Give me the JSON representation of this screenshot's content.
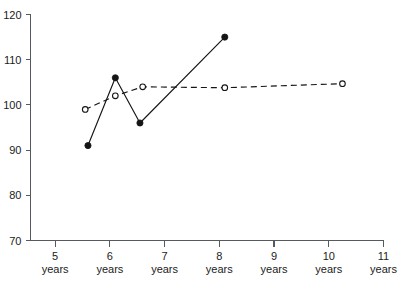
{
  "chart_data": {
    "type": "line",
    "title": "",
    "subtitle": "",
    "xlabel": "",
    "ylabel": "",
    "xlim": [
      4.55,
      11.0
    ],
    "ylim": [
      70,
      120
    ],
    "grid": false,
    "legend": "none",
    "x_ticks": [
      5,
      6,
      7,
      8,
      9,
      10,
      11
    ],
    "x_tick_labels": [
      "5",
      "6",
      "7",
      "8",
      "9",
      "10",
      "11"
    ],
    "x_tick_unit": "years",
    "x_tick_units": [
      "years",
      "years",
      "years",
      "years",
      "years",
      "years",
      "years"
    ],
    "y_ticks": [
      70,
      80,
      90,
      100,
      110,
      120
    ],
    "y_tick_labels": [
      "70",
      "80",
      "90",
      "100",
      "110",
      "120"
    ],
    "series": [
      {
        "name": "solid-filled-series",
        "line_style": "solid",
        "marker": "filled-circle",
        "color": "#151515",
        "x": [
          5.6,
          6.1,
          6.55,
          8.1
        ],
        "values": [
          91,
          106,
          96,
          115
        ]
      },
      {
        "name": "dashed-open-series",
        "line_style": "dashed",
        "marker": "open-circle",
        "color": "#151515",
        "x": [
          5.55,
          6.1,
          6.6,
          8.1,
          10.25
        ],
        "values": [
          99,
          102,
          104,
          103.8,
          104.7
        ]
      }
    ]
  },
  "axes": {
    "y_axis_name": "y-axis",
    "x_axis_name": "x-axis"
  }
}
